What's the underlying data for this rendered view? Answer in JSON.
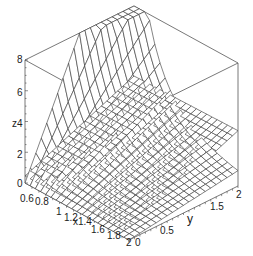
{
  "chart_data": {
    "type": "surface3d",
    "title": "",
    "xlabel": "x",
    "ylabel": "y",
    "zlabel": "z",
    "x_range": [
      0.5,
      2
    ],
    "y_range": [
      0,
      2
    ],
    "z_range": [
      0,
      8
    ],
    "x_ticks": [
      "0.6",
      "0.8",
      "1",
      "1.2",
      "1.4",
      "1.6",
      "1.8",
      "2"
    ],
    "y_ticks": [
      "0",
      "0.5",
      "1",
      "1.5",
      "2"
    ],
    "z_ticks": [
      "0",
      "2",
      "4",
      "6",
      "8"
    ],
    "grid_resolution": 20,
    "series": [
      {
        "name": "surface-1",
        "description": "steep curved surface rising to z=8 at x=0.5,y=2 corner",
        "formula_hint": "z = y / x^2 style"
      },
      {
        "name": "surface-2",
        "description": "nearly planar surface from ~0.4 to ~3.5",
        "formula_hint": "z = linear-like"
      }
    ],
    "box": true,
    "colors": {
      "mesh": "#333333",
      "box": "#555555",
      "background": "#ffffff"
    }
  },
  "labels": {
    "z8": "8",
    "z6": "6",
    "z4": "z4",
    "z2": "2",
    "z0": "0",
    "x06": "0.6",
    "x08": "0.8",
    "x1": "1",
    "x12": "1.2",
    "x14": "x1.4",
    "x16": "1.6",
    "x18": "1.8",
    "x2": "2",
    "y0": "0",
    "y05": "0.5",
    "y1": "y",
    "y15": "1.5",
    "y2": "2"
  }
}
